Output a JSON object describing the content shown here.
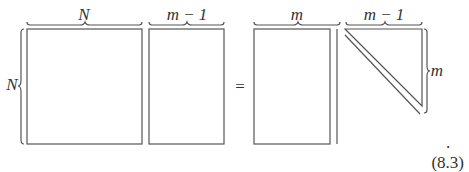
{
  "equation": {
    "lhs": {
      "matrix_a": {
        "width_label": "N",
        "height_label": "N"
      },
      "matrix_b": {
        "width_label": "m − 1"
      }
    },
    "operator": "=",
    "rhs": {
      "matrix_c": {
        "width_label": "m"
      },
      "matrix_d": {
        "width_label": "m − 1",
        "height_label": "m",
        "shape": "upper-triangular"
      }
    },
    "trailing_punct": ".",
    "number": "(8.3)"
  }
}
